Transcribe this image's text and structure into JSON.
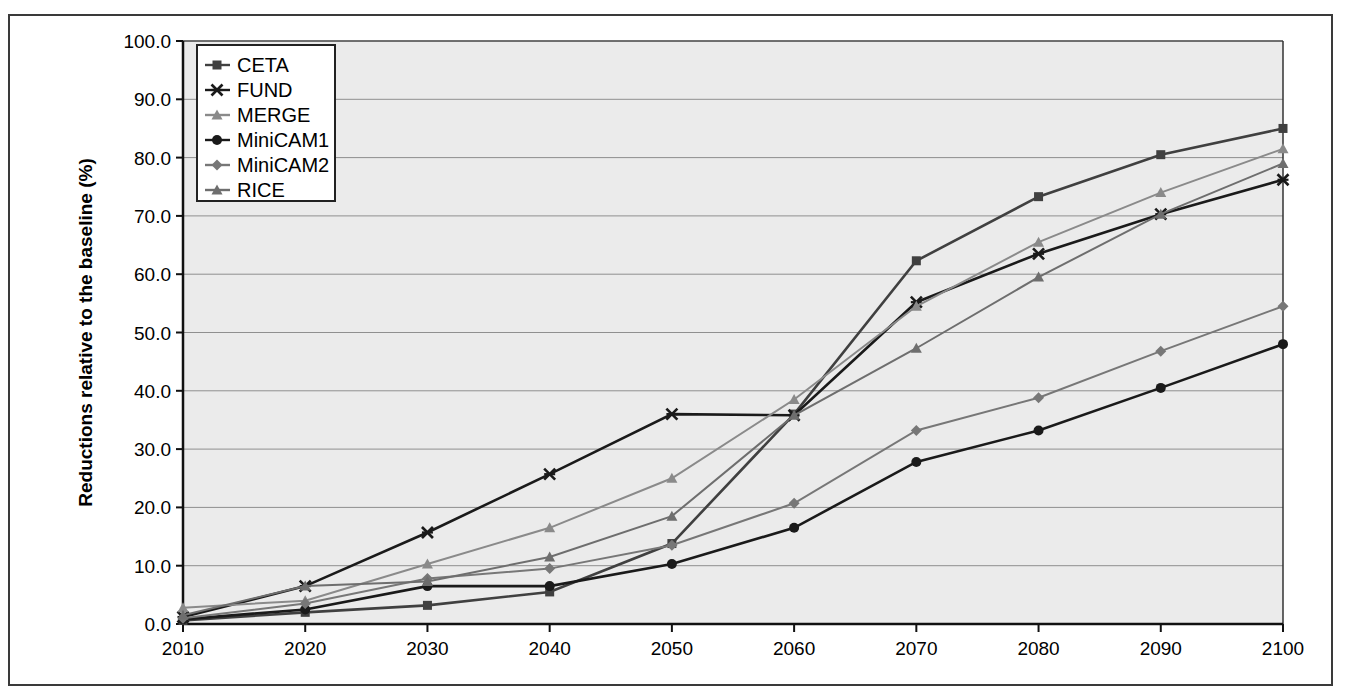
{
  "chart_data": {
    "type": "line",
    "title": "",
    "xlabel": "",
    "ylabel": "Reductions relative to the baseline (%)",
    "x": [
      2010,
      2020,
      2030,
      2040,
      2050,
      2060,
      2070,
      2080,
      2090,
      2100
    ],
    "xticklabels": [
      "2010",
      "2020",
      "2030",
      "2040",
      "2050",
      "2060",
      "2070",
      "2080",
      "2090",
      "2100"
    ],
    "yticklabels": [
      "0.0",
      "10.0",
      "20.0",
      "30.0",
      "40.0",
      "50.0",
      "60.0",
      "70.0",
      "80.0",
      "90.0",
      "100.0"
    ],
    "ytickvalues": [
      0,
      10,
      20,
      30,
      40,
      50,
      60,
      70,
      80,
      90,
      100
    ],
    "xlim": [
      2010,
      2100
    ],
    "ylim": [
      0,
      100
    ],
    "grid": "horizontal",
    "legend_position": "top-left-inside",
    "plot_background": "#ebebeb",
    "series": [
      {
        "name": "CETA",
        "marker": "square",
        "color": "#404040",
        "values": [
          0.6,
          2.0,
          3.2,
          5.5,
          13.8,
          36.0,
          62.3,
          73.3,
          80.5,
          85.0
        ]
      },
      {
        "name": "FUND",
        "marker": "x",
        "color": "#1a1a1a",
        "values": [
          1.2,
          6.5,
          15.7,
          25.7,
          36.0,
          35.8,
          55.2,
          63.5,
          70.3,
          76.2
        ]
      },
      {
        "name": "MERGE",
        "marker": "triangle",
        "color": "#8a8a8a",
        "values": [
          2.8,
          4.0,
          10.3,
          16.5,
          25.0,
          38.5,
          54.5,
          65.5,
          74.0,
          81.5
        ]
      },
      {
        "name": "MiniCAM1",
        "marker": "circle",
        "color": "#1a1a1a",
        "values": [
          0.8,
          2.5,
          6.5,
          6.5,
          10.3,
          16.5,
          27.8,
          33.2,
          40.5,
          48.0
        ]
      },
      {
        "name": "MiniCAM2",
        "marker": "diamond",
        "color": "#777777",
        "values": [
          1.0,
          3.5,
          7.8,
          9.5,
          13.5,
          20.7,
          33.2,
          38.8,
          46.8,
          54.5
        ]
      },
      {
        "name": "RICE",
        "marker": "triangle",
        "color": "#6e6e6e",
        "values": [
          1.5,
          6.5,
          7.3,
          11.5,
          18.5,
          35.8,
          47.3,
          59.5,
          70.3,
          79.0
        ]
      }
    ]
  }
}
